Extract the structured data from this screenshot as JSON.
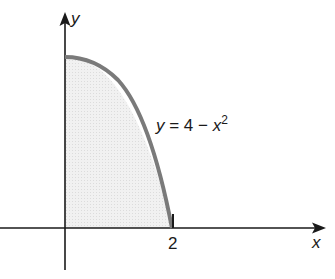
{
  "diagram": {
    "type": "function-graph",
    "axes": {
      "x_label": "x",
      "y_label": "y"
    },
    "ticks": {
      "x": [
        {
          "value": 2,
          "label": "2"
        }
      ]
    },
    "curve": {
      "equation_parts": {
        "y": "y",
        "eq": " = 4 − ",
        "x": "x",
        "exp": "2"
      },
      "domain": [
        0,
        2
      ],
      "y_intercept": 4,
      "x_intercept": 2
    },
    "shaded_region": "area under y = 4 − x² for 0 ≤ x ≤ 2, first quadrant",
    "colors": {
      "axis": "#1a1a1a",
      "curve": "#7a7a7a",
      "fill": "#ededed"
    }
  }
}
